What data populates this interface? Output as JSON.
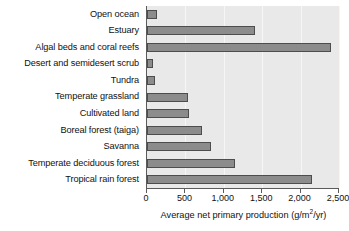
{
  "chart_data": {
    "type": "bar",
    "orientation": "horizontal",
    "title": "",
    "xlabel": "Average net primary production (g/m2/yr)",
    "xlabel_parts": {
      "pre": "Average net primary production (g/m",
      "sup": "2",
      "post": "/yr)"
    },
    "ylabel": "",
    "categories": [
      "Open ocean",
      "Estuary",
      "Algal beds and coral reefs",
      "Desert and semidesert scrub",
      "Tundra",
      "Temperate grassland",
      "Cultivated land",
      "Boreal forest (taiga)",
      "Savanna",
      "Temperate deciduous forest",
      "Tropical rain forest"
    ],
    "values": [
      125,
      1400,
      2400,
      80,
      100,
      530,
      550,
      720,
      830,
      1150,
      2150
    ],
    "xlim": [
      0,
      2500
    ],
    "xticks": [
      0,
      500,
      1000,
      1500,
      2000,
      2500
    ],
    "xtick_labels": [
      "0",
      "500",
      "1,000",
      "1,500",
      "2,000",
      "2,500"
    ],
    "grid": true,
    "legend": "none",
    "bar_color": "#8c8c8c",
    "bar_edge_color": "#4d4d4d",
    "plot_background": "#e9e9e9"
  }
}
